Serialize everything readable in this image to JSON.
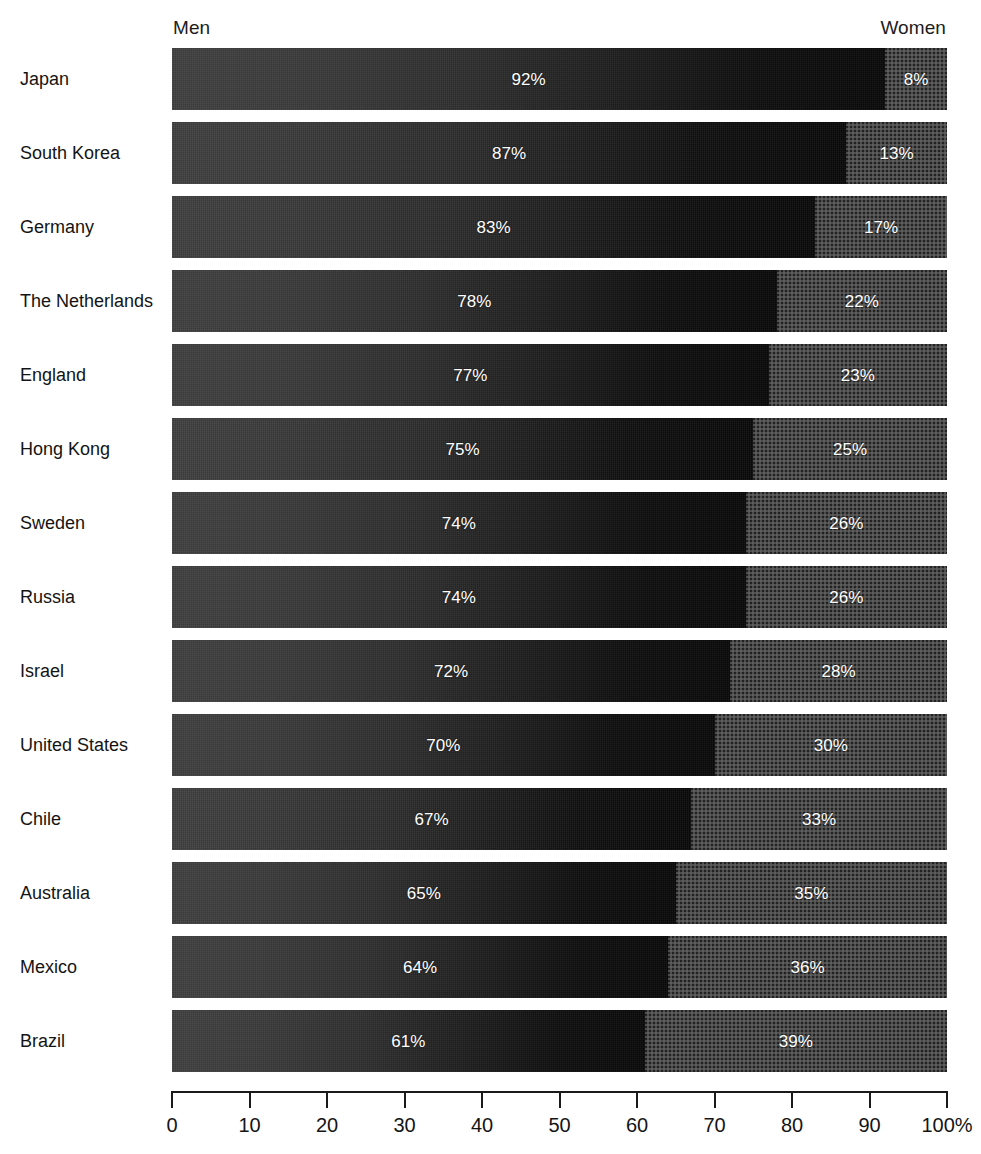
{
  "chart": {
    "type": "bar",
    "orientation": "horizontal",
    "stacked": true,
    "title": "",
    "header_left": "Men",
    "header_right": "Women",
    "axis_unit_suffix": "%",
    "colors": {
      "men_start": "#3f3f3f",
      "men_end": "#080808",
      "women": "#4d4d4d",
      "label_text": "#ffffff",
      "axis": "#1a1a1a",
      "background": "#ffffff"
    }
  },
  "chart_data": {
    "type": "bar",
    "orientation": "horizontal",
    "stacked": true,
    "title": "",
    "xlabel": "",
    "ylabel": "",
    "xlim": [
      0,
      100
    ],
    "grid": false,
    "legend_position": "top",
    "categories": [
      "Japan",
      "South Korea",
      "Germany",
      "The Netherlands",
      "England",
      "Hong Kong",
      "Sweden",
      "Russia",
      "Israel",
      "United States",
      "Chile",
      "Australia",
      "Mexico",
      "Brazil"
    ],
    "series": [
      {
        "name": "Men",
        "values": [
          92,
          87,
          83,
          78,
          77,
          75,
          74,
          74,
          72,
          70,
          67,
          65,
          64,
          61
        ],
        "labels": [
          "92%",
          "87%",
          "83%",
          "78%",
          "77%",
          "75%",
          "74%",
          "74%",
          "72%",
          "70%",
          "67%",
          "65%",
          "64%",
          "61%"
        ]
      },
      {
        "name": "Women",
        "values": [
          8,
          13,
          17,
          22,
          23,
          25,
          26,
          26,
          28,
          30,
          33,
          35,
          36,
          39
        ],
        "labels": [
          "8%",
          "13%",
          "17%",
          "22%",
          "23%",
          "25%",
          "26%",
          "26%",
          "28%",
          "30%",
          "33%",
          "35%",
          "36%",
          "39%"
        ]
      }
    ],
    "xticks": [
      0,
      10,
      20,
      30,
      40,
      50,
      60,
      70,
      80,
      90,
      100
    ],
    "xtick_labels": [
      "0",
      "10",
      "20",
      "30",
      "40",
      "50",
      "60",
      "70",
      "80",
      "90",
      "100%"
    ]
  }
}
